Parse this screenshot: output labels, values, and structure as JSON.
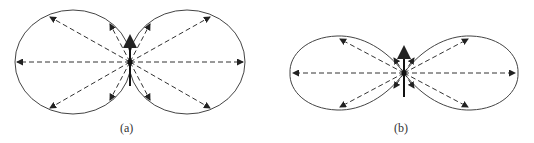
{
  "figures": [
    {
      "id": "a",
      "caption": "(a)",
      "description": "Dipole radiation pattern - circular lobes"
    },
    {
      "id": "b",
      "caption": "(b)",
      "description": "Dipole radiation pattern - elongated lobes"
    }
  ]
}
